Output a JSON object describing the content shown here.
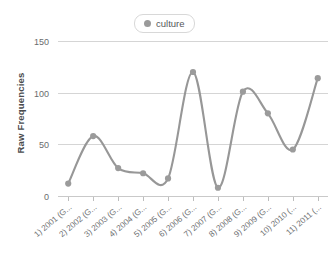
{
  "chart_data": {
    "type": "line",
    "title": "",
    "xlabel": "",
    "ylabel": "Raw Frequencies",
    "ylim": [
      0,
      150
    ],
    "yticks": [
      0,
      50,
      100,
      150
    ],
    "grid": true,
    "legend_position": "top-center",
    "series": [
      {
        "name": "culture",
        "color": "#9b9b9b",
        "marker": "circle",
        "values": [
          12,
          58,
          27,
          22,
          17,
          120,
          8,
          101,
          80,
          45,
          114
        ]
      }
    ],
    "categories": [
      "1) 2001 (G...",
      "2) 2002 (G...",
      "3) 2003 (G...",
      "4) 2004 (G...",
      "5) 2005 (G...",
      "6) 2006 (G...",
      "7) 2007 (G...",
      "8) 2008 (G...",
      "9) 2009 (G...",
      "10) 2010 (...",
      "11) 2011 (..."
    ]
  },
  "legend": {
    "entries": [
      {
        "label": "culture",
        "color": "#9b9b9b"
      }
    ]
  },
  "axes": {
    "y_title": "Raw Frequencies"
  }
}
